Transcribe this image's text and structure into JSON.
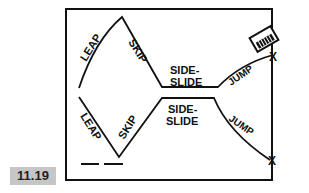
{
  "figure": {
    "number": "11.19",
    "colors": {
      "ink": "#111111",
      "badge_bg": "#c6c6c6",
      "badge_text": "#222222"
    }
  },
  "diagram": {
    "top_path": {
      "labels": [
        "LEAP",
        "SKIP",
        "SIDE-",
        "SLIDE",
        "JUMP"
      ],
      "end_mark": "X"
    },
    "bottom_path": {
      "labels": [
        "LEAP",
        "SKIP",
        "SIDE-",
        "SLIDE",
        "JUMP"
      ],
      "end_mark": "X"
    },
    "icon": "xylophone-icon"
  }
}
